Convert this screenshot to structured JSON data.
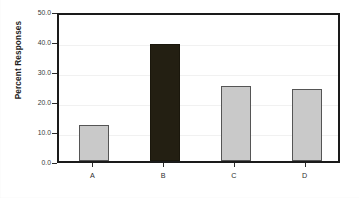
{
  "chart_data": {
    "type": "bar",
    "title": "",
    "subtitle": "",
    "xlabel": "",
    "ylabel": "Percent Responses",
    "categories": [
      "A",
      "B",
      "C",
      "D"
    ],
    "values": [
      12,
      39,
      25,
      24
    ],
    "ylim": [
      0,
      50
    ],
    "ytick_values": [
      0,
      10,
      20,
      30,
      40,
      50
    ],
    "ytick_labels": [
      "0.0",
      "10.0",
      "20.0",
      "30.0",
      "40.0",
      "50.0"
    ],
    "grid": true,
    "grid_axis": "y",
    "legend": false,
    "legend_position": "none",
    "annotations": [],
    "bar_colors": [
      "#c9c9c9",
      "#231f12",
      "#c9c9c9",
      "#c9c9c9"
    ],
    "bar_edge_color": "#4a4a4a",
    "highlighted_category": "B",
    "frame_color": "#1a1a1a",
    "grid_color": "#f1f1f1",
    "background_color": "#ffffff",
    "text_color": "#2e2e2e"
  }
}
